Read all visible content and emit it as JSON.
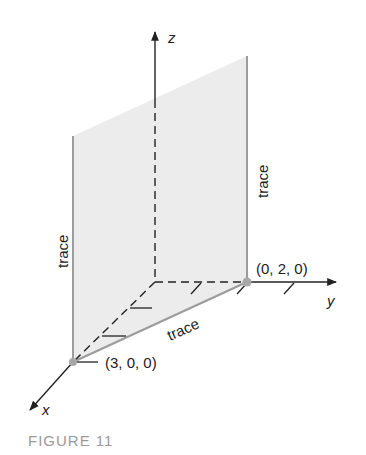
{
  "figure": {
    "caption": "FIGURE 11",
    "axes": {
      "x_label": "x",
      "y_label": "y",
      "z_label": "z"
    },
    "points": [
      {
        "label": "(3, 0, 0)",
        "coords": [
          3,
          0,
          0
        ]
      },
      {
        "label": "(0, 2, 0)",
        "coords": [
          0,
          2,
          0
        ]
      }
    ],
    "traces": {
      "left_vertical": "trace",
      "right_vertical": "trace",
      "xy_plane": "trace"
    },
    "colors": {
      "plane_fill": "#ececec",
      "trace_line": "#9c9c9c",
      "axis": "#222222",
      "point": "#a8a8a8",
      "caption": "#9a9a9a"
    }
  }
}
